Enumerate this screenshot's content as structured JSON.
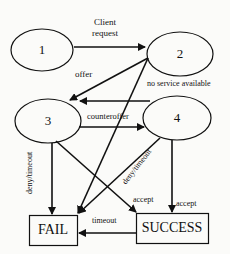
{
  "diagram": {
    "type": "state-transition",
    "nodes": [
      {
        "id": "1",
        "label": "1",
        "shape": "ellipse"
      },
      {
        "id": "2",
        "label": "2",
        "shape": "ellipse"
      },
      {
        "id": "3",
        "label": "3",
        "shape": "ellipse"
      },
      {
        "id": "4",
        "label": "4",
        "shape": "ellipse"
      },
      {
        "id": "fail",
        "label": "FAIL",
        "shape": "rectangle"
      },
      {
        "id": "success",
        "label": "SUCCESS",
        "shape": "rectangle"
      }
    ],
    "edges": [
      {
        "from": "1",
        "to": "2",
        "label_line1": "Client",
        "label_line2": "request"
      },
      {
        "from": "2",
        "to": "3",
        "label": "offer"
      },
      {
        "from": "4",
        "to": "3",
        "label": "no service available"
      },
      {
        "from": "3",
        "to": "4",
        "label": "counteroffer"
      },
      {
        "from": "3",
        "to": "fail",
        "label": "deny/timeout"
      },
      {
        "from": "3",
        "to": "success",
        "label": "accept"
      },
      {
        "from": "2",
        "to": "fail",
        "label": ""
      },
      {
        "from": "4",
        "to": "fail",
        "label": "deny/timeout"
      },
      {
        "from": "4",
        "to": "success",
        "label": "accept"
      },
      {
        "from": "success",
        "to": "fail",
        "label": "timeout"
      }
    ]
  }
}
